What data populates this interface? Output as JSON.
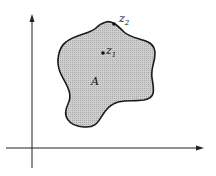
{
  "diagram": {
    "type": "complex-plane-region",
    "region": {
      "label": "A",
      "fill": "#c8c8c8",
      "stroke": "#1a1a1a"
    },
    "points": [
      {
        "name": "z",
        "subscript": "1",
        "location": "interior"
      },
      {
        "name": "z",
        "subscript": "2",
        "location": "boundary"
      }
    ],
    "axes": {
      "color": "#222222"
    }
  }
}
